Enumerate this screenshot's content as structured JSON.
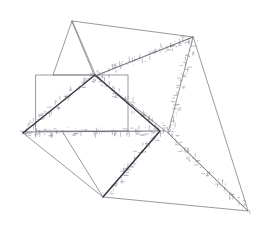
{
  "figure": {
    "width": 263,
    "height": 228,
    "background_color": "#ffffff",
    "stroke_colors": {
      "thin": "#6e6e78",
      "mid": "#5a5a66",
      "bold": "#3a3a46",
      "marker": "#8a8a96"
    }
  },
  "shapes": [
    {
      "name": "small-triangle-top-left",
      "kind": "polygon",
      "weight": "thin",
      "points": [
        [
          72,
          21
        ],
        [
          53,
          75
        ],
        [
          95,
          75
        ]
      ]
    },
    {
      "name": "large-thin-triangle-upper",
      "kind": "polygon",
      "weight": "thin",
      "points": [
        [
          72,
          21
        ],
        [
          193,
          37
        ],
        [
          95,
          76
        ]
      ]
    },
    {
      "name": "rectangle-left",
      "kind": "polygon",
      "weight": "thin",
      "points": [
        [
          36,
          75
        ],
        [
          128,
          75
        ],
        [
          128,
          131
        ],
        [
          36,
          131
        ]
      ]
    },
    {
      "name": "tall-narrow-triangle-right",
      "kind": "polygon",
      "weight": "thin",
      "points": [
        [
          193,
          37
        ],
        [
          168,
          133
        ],
        [
          248,
          211
        ]
      ]
    },
    {
      "name": "large-open-quadrilateral",
      "kind": "polyline",
      "weight": "thin",
      "points": [
        [
          95,
          76
        ],
        [
          168,
          133
        ],
        [
          248,
          211
        ],
        [
          103,
          197
        ],
        [
          62,
          131
        ]
      ]
    },
    {
      "name": "lower-left-triangle",
      "kind": "polyline",
      "weight": "thin",
      "points": [
        [
          23,
          133
        ],
        [
          103,
          197
        ],
        [
          160,
          131
        ]
      ]
    },
    {
      "name": "horizontal-baseline",
      "kind": "polyline",
      "weight": "mid",
      "points": [
        [
          23,
          132
        ],
        [
          160,
          131
        ]
      ]
    },
    {
      "name": "bold-zigzag-path",
      "kind": "polyline",
      "weight": "bold",
      "points": [
        [
          23,
          133
        ],
        [
          95,
          75
        ],
        [
          160,
          131
        ],
        [
          103,
          197
        ]
      ]
    },
    {
      "name": "thin-diagonal-crossing",
      "kind": "polyline",
      "weight": "thin",
      "points": [
        [
          95,
          76
        ],
        [
          193,
          37
        ]
      ]
    }
  ],
  "marker_paths": [
    {
      "name": "markers-upper-arc",
      "from": [
        95,
        76
      ],
      "to": [
        193,
        37
      ],
      "count": 30,
      "spread": 9
    },
    {
      "name": "markers-bold-descending",
      "from": [
        95,
        76
      ],
      "to": [
        168,
        133
      ],
      "count": 26,
      "spread": 9
    },
    {
      "name": "markers-baseline",
      "from": [
        23,
        132
      ],
      "to": [
        160,
        131
      ],
      "count": 32,
      "spread": 8
    },
    {
      "name": "markers-bold-ascending",
      "from": [
        23,
        133
      ],
      "to": [
        95,
        75
      ],
      "count": 24,
      "spread": 9
    },
    {
      "name": "markers-right-descending",
      "from": [
        193,
        40
      ],
      "to": [
        168,
        133
      ],
      "count": 24,
      "spread": 10
    },
    {
      "name": "markers-lower-diagonal",
      "from": [
        160,
        131
      ],
      "to": [
        103,
        197
      ],
      "count": 24,
      "spread": 9
    },
    {
      "name": "markers-lower-right-edge",
      "from": [
        168,
        133
      ],
      "to": [
        248,
        211
      ],
      "count": 26,
      "spread": 9
    }
  ]
}
